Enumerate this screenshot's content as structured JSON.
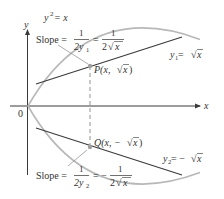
{
  "figure": {
    "type": "diagram",
    "colors": {
      "axis": "#3a3a3a",
      "curve": "#b0b0b0",
      "tangent": "#3a3a3a",
      "dashed": "#777777",
      "point": "#9a9a9a",
      "text": "#333333"
    },
    "axes": {
      "x_label": "x",
      "y_label": "y",
      "origin_label": "0"
    },
    "curve_label": {
      "lhs": "y",
      "exp": "2",
      "rest": " = x"
    },
    "upper": {
      "slope_word": "Slope =",
      "frac1_num": "1",
      "frac1_den_main": "2y",
      "frac1_den_sub": "1",
      "eq": "=",
      "frac2_num": "1",
      "frac2_den_pre": "2",
      "frac2_den_rad": "x",
      "point_label_pre": "P(x, ",
      "point_label_rad": "x",
      "point_label_post": ")",
      "func_label_pre": "y",
      "func_label_sub": "1",
      "func_label_eq": " = ",
      "func_label_rad": "x"
    },
    "lower": {
      "slope_word": "Slope =",
      "frac1_num": "1",
      "frac1_den_main": "2y",
      "frac1_den_sub": "2",
      "eq": "= −",
      "frac2_num": "1",
      "frac2_den_pre": "2",
      "frac2_den_rad": "x",
      "point_label_pre": "Q(x, −",
      "point_label_rad": "x",
      "point_label_post": ")",
      "func_label_pre": "y",
      "func_label_sub": "2",
      "func_label_eq": " = −",
      "func_label_rad": "x"
    }
  }
}
